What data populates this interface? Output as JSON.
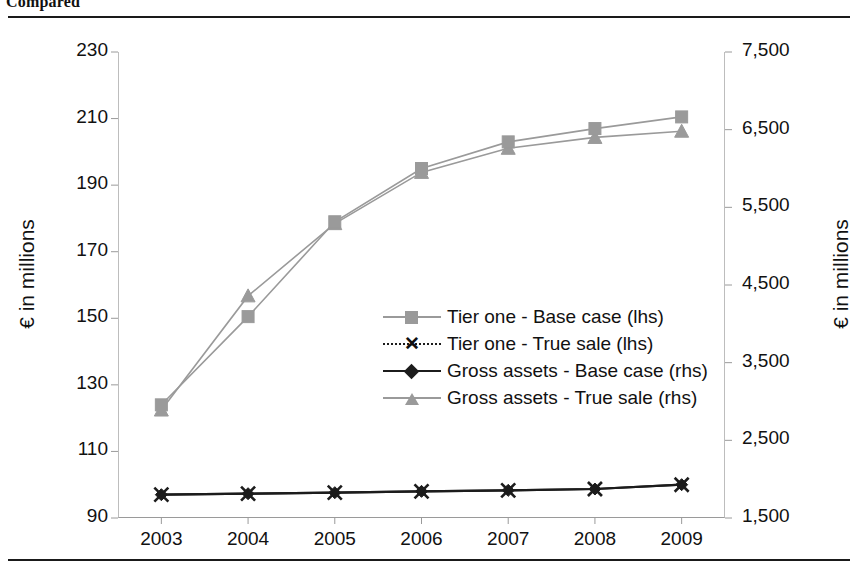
{
  "caption": "Compared",
  "chart_data": {
    "type": "line",
    "title": "Compared",
    "xlabel": "",
    "ylabel": "€ in millions",
    "y2label": "€ in millions",
    "categories": [
      "2003",
      "2004",
      "2005",
      "2006",
      "2007",
      "2008",
      "2009"
    ],
    "x_tick_labels": [
      "2003",
      "2004",
      "2005",
      "2006",
      "2007",
      "2008",
      "2009"
    ],
    "ylim": [
      90,
      230
    ],
    "y_tick_labels": [
      "230",
      "210",
      "190",
      "170",
      "150",
      "130",
      "110",
      "90"
    ],
    "y_ticks": [
      230,
      210,
      190,
      170,
      150,
      130,
      110,
      90
    ],
    "y2lim": [
      1500,
      7500
    ],
    "y2_tick_labels": [
      "7,500",
      "6,500",
      "5,500",
      "4,500",
      "3,500",
      "2,500",
      "1,500"
    ],
    "y2_ticks": [
      7500,
      6500,
      5500,
      4500,
      3500,
      2500,
      1500
    ],
    "grid": false,
    "legend_position": "center",
    "series": [
      {
        "name": "Tier one - Base case (lhs)",
        "axis": "left",
        "marker": "square",
        "color": "#9a9a9a",
        "values": [
          124,
          150.5,
          179,
          195,
          203,
          207,
          210.5
        ]
      },
      {
        "name": "Tier one - True sale (lhs)",
        "axis": "left",
        "marker": "x",
        "color": "#1c1c1c",
        "values": [
          97,
          97.3,
          97.6,
          98,
          98.3,
          98.7,
          100
        ]
      },
      {
        "name": "Gross assets - Base case (rhs)",
        "axis": "right",
        "marker": "diamond",
        "color": "#1c1c1c",
        "values": [
          1800,
          1813,
          1826,
          1843,
          1856,
          1873,
          1929
        ]
      },
      {
        "name": "Gross assets - True sale (rhs)",
        "axis": "right",
        "marker": "triangle",
        "color": "#9a9a9a",
        "values": [
          2890,
          4360,
          5290,
          5950,
          6260,
          6400,
          6480
        ]
      }
    ]
  },
  "legend": {
    "items": [
      {
        "label": "Tier one - Base case (lhs)",
        "marker": "square",
        "line": "solid",
        "color": "#9a9a9a"
      },
      {
        "label": "Tier one - True sale (lhs)",
        "marker": "x",
        "line": "dotted",
        "color": "#1c1c1c"
      },
      {
        "label": "Gross assets - Base case (rhs)",
        "marker": "diamond",
        "line": "solid",
        "color": "#1c1c1c"
      },
      {
        "label": "Gross assets - True sale (rhs)",
        "marker": "triangle",
        "line": "solid",
        "color": "#9a9a9a"
      }
    ]
  }
}
